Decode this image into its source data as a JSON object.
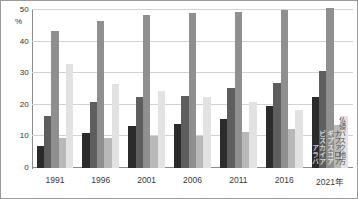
{
  "chart_data": {
    "type": "bar",
    "title": "",
    "xlabel": "",
    "ylabel": "%",
    "ylim": [
      0,
      50
    ],
    "yticks": [
      0,
      10,
      20,
      30,
      40,
      50
    ],
    "grid": true,
    "legend_position": "inline-right",
    "unit_label": "%",
    "categories": [
      "1991",
      "1996",
      "2001",
      "2006",
      "2011",
      "2016",
      "2021年"
    ],
    "series": [
      {
        "name": "アラバ",
        "color": "#2b2b2b",
        "values": [
          7.0,
          11.2,
          13.2,
          14.0,
          15.5,
          19.5,
          22.5
        ]
      },
      {
        "name": "ビスカイア",
        "color": "#5e5e5e",
        "values": [
          16.5,
          20.8,
          22.5,
          22.7,
          25.2,
          27.0,
          30.8
        ]
      },
      {
        "name": "ギプスコア",
        "color": "#8f8f8f",
        "values": [
          43.5,
          46.5,
          48.5,
          49.0,
          49.5,
          50.0,
          50.5
        ]
      },
      {
        "name": "ナファロア",
        "color": "#b8b8b8",
        "values": [
          9.5,
          9.5,
          10.0,
          10.2,
          11.3,
          12.5,
          13.5
        ]
      },
      {
        "name": "仏領バスク地方",
        "color": "#e2e2e2",
        "values": [
          32.8,
          26.5,
          24.5,
          22.5,
          20.8,
          18.5,
          16.5
        ]
      }
    ]
  },
  "axis": {
    "y_unit": "%",
    "tick_0": "0",
    "tick_10": "10",
    "tick_20": "20",
    "tick_30": "30",
    "tick_40": "40",
    "tick_50": "50"
  },
  "series_labels": {
    "gipuzkoa": "ギプスコア",
    "bizkaia": "ビスカイア",
    "araba": "アラバ",
    "french_basque": "仏領バスク地方",
    "nafarroa": "ナファロア"
  }
}
